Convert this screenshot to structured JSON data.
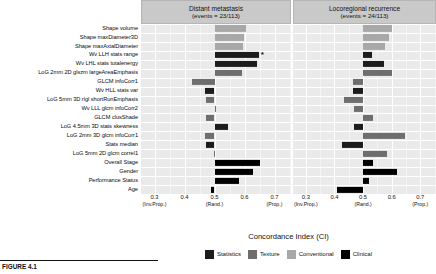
{
  "axis_title": "Concordance Index (CI)",
  "caption": "FIGURE 4.1",
  "colors": {
    "statistics": "#1c1c1c",
    "texture": "#6e6e6e",
    "conventional": "#a8a8a8",
    "clinical": "#000000",
    "panel_header": "#c9c9c9",
    "plot_bg": "#eaeaea",
    "grid": "#ffffff"
  },
  "legend": {
    "items": [
      {
        "label": "Statistics",
        "color_key": "statistics"
      },
      {
        "label": "Texture",
        "color_key": "texture"
      },
      {
        "label": "Conventional",
        "color_key": "conventional"
      },
      {
        "label": "Clinical",
        "color_key": "clinical"
      }
    ]
  },
  "features": [
    "Shape volume",
    "Shape maxDiameter3D",
    "Shape maxAxialDiameter",
    "Wv LLH stats range",
    "Wv LHL stats totalenergy",
    "LoG 2mm 2D glszm largeAreaEmphasis",
    "GLCM infoCorr1",
    "Wv HLL stats var",
    "LoG 5mm 3D rlgl shortRunEmphasis",
    "Wv LLL glcm infoCorr2",
    "GLCM clusShade",
    "LoG 4.5mm 3D stats skewness",
    "LoG 2mm 3D glcm infoCorr1",
    "Stats median",
    "LoG 5mm 2D glcm correl1",
    "Overall Stage",
    "Gender",
    "Performance Status",
    "Age"
  ],
  "xaxis": {
    "ticks": [
      {
        "value": "0.3",
        "sub": "(Inv.Prop.)",
        "pos": 0.3
      },
      {
        "value": "0.4",
        "sub": "",
        "pos": 0.4
      },
      {
        "value": "0.5",
        "sub": "(Rand.)",
        "pos": 0.5
      },
      {
        "value": "0.6",
        "sub": "",
        "pos": 0.6
      },
      {
        "value": "0.7",
        "sub": "(Prop.)",
        "pos": 0.7
      }
    ],
    "range": [
      0.255,
      0.755
    ],
    "baseline": 0.5
  },
  "chart_data": {
    "type": "bar",
    "xlabel": "Concordance Index (CI)",
    "ylabel": "",
    "orientation": "horizontal",
    "baseline": 0.5,
    "xlim": [
      0.255,
      0.755
    ],
    "xticks": [
      0.3,
      0.4,
      0.5,
      0.6,
      0.7
    ],
    "xtick_sublabels": [
      "(Inv.Prop.)",
      "",
      "(Rand.)",
      "",
      "(Prop.)"
    ],
    "grid": true,
    "legend_position": "bottom",
    "categories": [
      "Shape volume",
      "Shape maxDiameter3D",
      "Shape maxAxialDiameter",
      "Wv LLH stats range",
      "Wv LHL stats totalenergy",
      "LoG 2mm 2D glszm largeAreaEmphasis",
      "GLCM infoCorr1",
      "Wv HLL stats var",
      "LoG 5mm 3D rlgl shortRunEmphasis",
      "Wv LLL glcm infoCorr2",
      "GLCM clusShade",
      "LoG 4.5mm 3D stats skewness",
      "LoG 2mm 3D glcm infoCorr1",
      "Stats median",
      "LoG 5mm 2D glcm correl1",
      "Overall Stage",
      "Gender",
      "Performance Status",
      "Age"
    ],
    "category_groups": [
      "conventional",
      "conventional",
      "conventional",
      "statistics",
      "statistics",
      "texture",
      "texture",
      "statistics",
      "texture",
      "texture",
      "texture",
      "statistics",
      "texture",
      "statistics",
      "texture",
      "clinical",
      "clinical",
      "clinical",
      "clinical"
    ],
    "panels": [
      {
        "name": "Distant metastasis",
        "events": "events = 23/113",
        "values": [
          0.605,
          0.598,
          0.595,
          0.648,
          0.64,
          0.592,
          0.425,
          0.468,
          0.471,
          0.506,
          0.473,
          0.546,
          0.467,
          0.472,
          0.497,
          0.652,
          0.628,
          0.58,
          0.488
        ],
        "significant": [
          false,
          false,
          false,
          true,
          false,
          false,
          false,
          false,
          false,
          false,
          false,
          false,
          false,
          false,
          false,
          false,
          false,
          false,
          false
        ]
      },
      {
        "name": "Locoregional recurrence",
        "events": "events = 24/113",
        "values": [
          0.6,
          0.592,
          0.578,
          0.53,
          0.574,
          0.601,
          0.466,
          0.466,
          0.435,
          0.47,
          0.533,
          0.47,
          0.647,
          0.425,
          0.584,
          0.534,
          0.618,
          0.52,
          0.408
        ],
        "significant": [
          false,
          false,
          false,
          false,
          false,
          false,
          false,
          false,
          false,
          false,
          false,
          false,
          false,
          false,
          false,
          false,
          false,
          false,
          false
        ]
      }
    ],
    "series": [
      {
        "name": "Distant metastasis (events = 23/113)",
        "values": [
          0.605,
          0.598,
          0.595,
          0.648,
          0.64,
          0.592,
          0.425,
          0.468,
          0.471,
          0.506,
          0.473,
          0.546,
          0.467,
          0.472,
          0.497,
          0.652,
          0.628,
          0.58,
          0.488
        ]
      },
      {
        "name": "Locoregional recurrence (events = 24/113)",
        "values": [
          0.6,
          0.592,
          0.578,
          0.53,
          0.574,
          0.601,
          0.466,
          0.466,
          0.435,
          0.47,
          0.533,
          0.47,
          0.647,
          0.425,
          0.584,
          0.534,
          0.618,
          0.52,
          0.408
        ]
      }
    ],
    "annotations": [
      {
        "panel": "Distant metastasis",
        "category": "Wv LLH stats range",
        "marker": "*"
      }
    ]
  }
}
